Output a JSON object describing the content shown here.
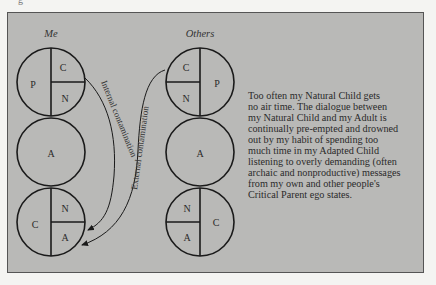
{
  "page_mark": "g",
  "diagram": {
    "columns": [
      {
        "label": "Me",
        "circles": [
          {
            "type": "parent-split",
            "left": "P",
            "top_right": "C",
            "bottom_right": "N"
          },
          {
            "type": "adult",
            "label": "A"
          },
          {
            "type": "child-split",
            "left": "C",
            "top_right": "N",
            "bottom_right": "A"
          }
        ]
      },
      {
        "label": "Others",
        "circles": [
          {
            "type": "parent-split",
            "top_left": "C",
            "bottom_left": "N",
            "right": "P"
          },
          {
            "type": "adult",
            "label": "A"
          },
          {
            "type": "child-split",
            "top_left": "N",
            "bottom_left": "A",
            "right": "C"
          }
        ]
      }
    ],
    "arrows": [
      {
        "label": "Internal contamination",
        "from": "Me.Parent.C",
        "to": "Me.Child.A"
      },
      {
        "label": "External contamination",
        "from": "Others.Parent.C",
        "to": "Me.Child.A"
      }
    ]
  },
  "caption": {
    "lines": [
      "Too often my Natural Child gets",
      "no air time. The dialogue between",
      "my Natural Child and my Adult is",
      "continually pre-empted and drowned",
      "out by my habit of spending too",
      "much time in my Adapted Child",
      "listening to overly demanding (often",
      "archaic and nonproductive) messages",
      "from my own and other people's",
      "Critical Parent ego states."
    ]
  }
}
